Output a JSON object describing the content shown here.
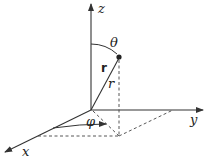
{
  "diagram": {
    "axes": {
      "z": {
        "label": "z"
      },
      "y": {
        "label": "y"
      },
      "x": {
        "label": "x"
      }
    },
    "labels": {
      "theta": "θ",
      "phi": "φ",
      "r_vector": "r",
      "r_magnitude": "r"
    },
    "colors": {
      "line": "#333333",
      "background": "#ffffff"
    }
  }
}
